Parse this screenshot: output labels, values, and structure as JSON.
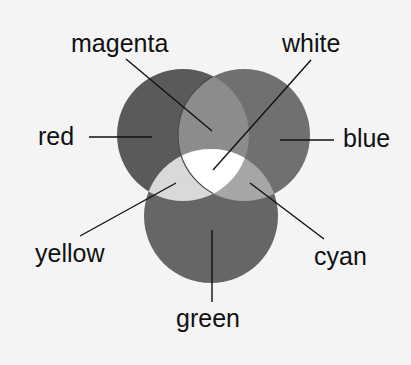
{
  "diagram": {
    "type": "additive-color-venn",
    "background": "#f4f4f4",
    "circles": [
      {
        "name": "red",
        "cx": 183,
        "cy": 135,
        "r": 66,
        "fill": "#5a5a5a"
      },
      {
        "name": "blue",
        "cx": 244,
        "cy": 135,
        "r": 66,
        "fill": "#707070"
      },
      {
        "name": "green",
        "cx": 211,
        "cy": 216,
        "r": 67,
        "fill": "#666666"
      }
    ],
    "overlaps": {
      "magenta": "#8c8c8c",
      "yellow": "#d9d9d9",
      "cyan": "#a6a6a6",
      "white": "#ffffff"
    },
    "labels": {
      "magenta": "magenta",
      "white": "white",
      "red": "red",
      "blue": "blue",
      "yellow": "yellow",
      "cyan": "cyan",
      "green": "green"
    }
  }
}
